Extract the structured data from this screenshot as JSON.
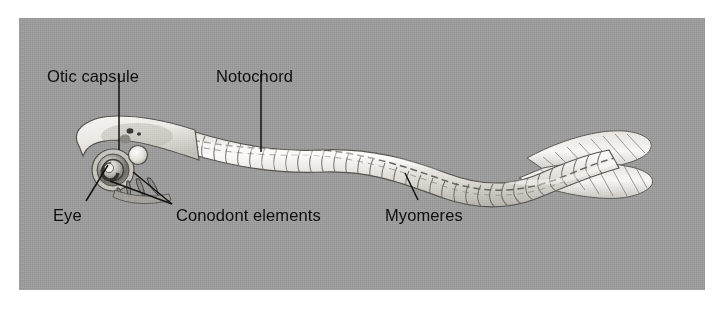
{
  "figure": {
    "kind": "anatomical-diagram",
    "background_color": "#9b9b9b",
    "page_color": "#ffffff",
    "label_color": "#0d0d0d",
    "leader_line_color": "#111111",
    "body_fill_light": "#f2f0ec",
    "body_fill_mid": "#d8d5cf",
    "body_outline": "#55534f"
  },
  "labels": [
    {
      "id": "otic-capsule",
      "text": "Otic capsule",
      "x": 47,
      "y": 68
    },
    {
      "id": "notochord",
      "text": "Notochord",
      "x": 216,
      "y": 68
    },
    {
      "id": "eye",
      "text": "Eye",
      "x": 53,
      "y": 207
    },
    {
      "id": "conodont-elements",
      "text": "Conodont elements",
      "x": 176,
      "y": 207
    },
    {
      "id": "myomeres",
      "text": "Myomeres",
      "x": 385,
      "y": 207
    }
  ],
  "leaders": [
    {
      "id": "otic-capsule-leader",
      "from": [
        119,
        92
      ],
      "to": [
        119,
        150
      ]
    },
    {
      "id": "notochord-leader",
      "from": [
        261,
        92
      ],
      "to": [
        261,
        152
      ]
    },
    {
      "id": "eye-leader",
      "from": [
        86,
        201
      ],
      "to": [
        108,
        165
      ]
    },
    {
      "id": "conodont-leader-a",
      "from": [
        172,
        204
      ],
      "to": [
        110,
        181
      ]
    },
    {
      "id": "conodont-leader-b",
      "from": [
        172,
        204
      ],
      "to": [
        133,
        172
      ]
    },
    {
      "id": "myomeres-leader",
      "from": [
        418,
        200
      ],
      "to": [
        405,
        173
      ]
    }
  ],
  "anatomy_parts": [
    "head",
    "eye",
    "otic capsule",
    "conodont elements",
    "notochord",
    "myomeres",
    "trunk",
    "caudal fin"
  ]
}
